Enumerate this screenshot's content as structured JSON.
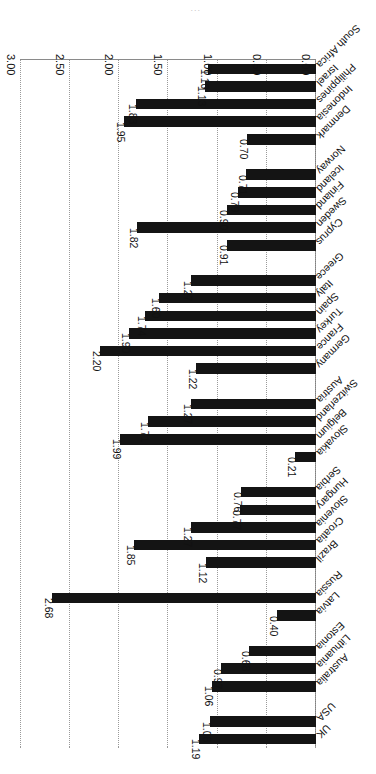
{
  "chart_data": {
    "type": "bar",
    "orientation": "horizontal",
    "title": "",
    "subtitle": "",
    "xlabel": "",
    "ylabel": "",
    "xlim": [
      0.0,
      3.0
    ],
    "xticks": [
      "0.00",
      "0.50",
      "1.00",
      "1.50",
      "2.00",
      "2.50",
      "3.00"
    ],
    "xtick_values": [
      0.0,
      0.5,
      1.0,
      1.5,
      2.0,
      2.5,
      3.0
    ],
    "grid": true,
    "legend": false,
    "bar_color": "#141414",
    "grid_color": "#9a9a9a",
    "axis_color": "#808080",
    "rotated_180": true,
    "categories": [
      "UK",
      "USA",
      "Australia",
      "Lithuania",
      "Estonia",
      "Latvia",
      "Russia",
      "Brazil",
      "Croatia",
      "Slovenia",
      "Hungary",
      "Serbia",
      "Slovakia",
      "Belgium",
      "Switzerland",
      "Austria",
      "Germany",
      "France",
      "Turkey",
      "Spain",
      "Italy",
      "Greece",
      "Cyprus",
      "Sweden",
      "Finland",
      "Iceland",
      "Norway",
      "Denmark",
      "Indonesia",
      "Philippines",
      "Israel",
      "South Africa"
    ],
    "values": [
      1.19,
      1.08,
      1.06,
      0.97,
      0.68,
      0.4,
      2.68,
      1.12,
      1.85,
      1.27,
      0.77,
      0.76,
      0.21,
      1.99,
      1.71,
      1.27,
      1.22,
      2.2,
      1.9,
      1.74,
      1.6,
      1.27,
      0.91,
      1.82,
      0.9,
      0.79,
      0.71,
      0.7,
      1.95,
      1.83,
      1.13,
      1.1
    ],
    "value_labels": [
      "1.19",
      "1.08",
      "1.06",
      "0.97",
      "0.68",
      "0.40",
      "2.68",
      "1.12",
      "1.85",
      "1.27",
      "0.77",
      "0.76",
      "0.21",
      "1.99",
      "1.71",
      "1.27",
      "1.22",
      "2.20",
      "1.90",
      "1.74",
      "1.60",
      "1.27",
      "0.91",
      "1.82",
      "0.90",
      "0.79",
      "0.71",
      "0.70",
      "1.95",
      "1.83",
      "1.13",
      "1.10"
    ],
    "group_breaks_after": [
      2,
      5,
      7,
      12,
      16,
      22,
      27
    ],
    "axis_caption": "..."
  }
}
